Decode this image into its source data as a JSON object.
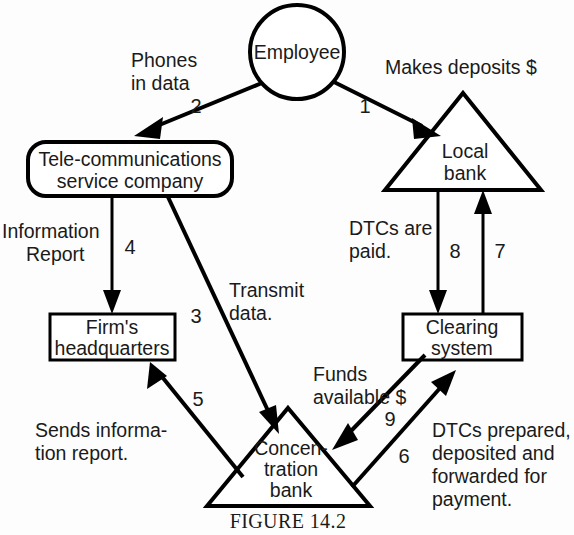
{
  "figure": {
    "caption": "FIGURE 14.2",
    "colors": {
      "background": "#fdfdfd",
      "stroke": "#000000",
      "text": "#1a1a1a"
    }
  },
  "nodes": {
    "employee": {
      "label": "Employee",
      "shape": "circle"
    },
    "telecom": {
      "line1": "Tele-communications",
      "line2": "service company",
      "shape": "rounded-rectangle"
    },
    "headquarters": {
      "line1": "Firm's",
      "line2": "headquarters",
      "shape": "rectangle"
    },
    "local_bank": {
      "line1": "Local",
      "line2": "bank",
      "shape": "triangle"
    },
    "clearing": {
      "line1": "Clearing",
      "line2": "system",
      "shape": "rectangle"
    },
    "concentration": {
      "line1": "Concen-",
      "line2": "tration",
      "line3": "bank",
      "shape": "triangle"
    }
  },
  "edges": [
    {
      "id": "e1",
      "number": "1",
      "label_lines": [
        "Makes deposits $"
      ],
      "from": "employee",
      "to": "local_bank"
    },
    {
      "id": "e2",
      "number": "2",
      "label_lines": [
        "Phones",
        "in data"
      ],
      "from": "employee",
      "to": "telecom"
    },
    {
      "id": "e3",
      "number": "3",
      "label_lines": [
        "Transmit",
        "data."
      ],
      "from": "telecom",
      "to": "concentration"
    },
    {
      "id": "e4",
      "number": "4",
      "label_lines": [
        "Information",
        "Report"
      ],
      "from": "telecom",
      "to": "headquarters"
    },
    {
      "id": "e5",
      "number": "5",
      "label_lines": [
        "Sends informa-",
        "tion report."
      ],
      "from": "concentration",
      "to": "headquarters"
    },
    {
      "id": "e6",
      "number": "6",
      "label_lines": [
        "DTCs prepared,",
        "deposited and",
        "forwarded for",
        "payment."
      ],
      "from": "concentration",
      "to": "clearing"
    },
    {
      "id": "e7",
      "number": "7",
      "label_lines": [],
      "from": "clearing",
      "to": "local_bank"
    },
    {
      "id": "e8",
      "number": "8",
      "label_lines": [
        "DTCs are",
        "paid."
      ],
      "from": "local_bank",
      "to": "clearing"
    },
    {
      "id": "e9",
      "number": "9",
      "label_lines": [
        "Funds",
        "available $"
      ],
      "from": "clearing",
      "to": "concentration"
    }
  ]
}
